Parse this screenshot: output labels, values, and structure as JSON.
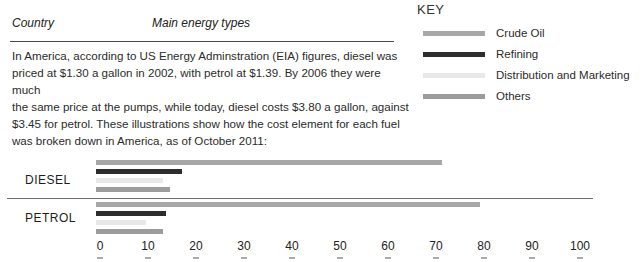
{
  "header": {
    "col1": "Country",
    "col2": "Main energy types"
  },
  "paragraph_lines": [
    "In America, according to US Energy Adminstration (EIA) figures, diesel was",
    "priced at $1.30 a gallon in 2002, with petrol at $1.39. By 2006 they were much",
    "the same price at the pumps, while today, diesel costs $3.80 a gallon, against",
    "$3.45 for petrol. These illustrations show how the cost element for each fuel",
    "was broken down in America, as of October 2011:"
  ],
  "key": {
    "title": "KEY",
    "items": [
      {
        "label": "Crude Oil",
        "color": "#a7a7a7"
      },
      {
        "label": "Refining",
        "color": "#2d2d2d"
      },
      {
        "label": "Distribution and Marketing",
        "color": "#e8e8e8"
      },
      {
        "label": "Others",
        "color": "#9c9c9c"
      }
    ]
  },
  "chart_data": {
    "type": "bar",
    "orientation": "horizontal",
    "title": "",
    "xlabel": "",
    "ylabel": "",
    "categories": [
      "DIESEL",
      "PETROL"
    ],
    "series": [
      {
        "name": "Crude Oil",
        "color": "#a7a7a7",
        "values": [
          72,
          80
        ]
      },
      {
        "name": "Refining",
        "color": "#2d2d2d",
        "values": [
          18,
          14.5
        ]
      },
      {
        "name": "Distribution and Marketing",
        "color": "#e8e8e8",
        "values": [
          14,
          10.5
        ]
      },
      {
        "name": "Others",
        "color": "#9c9c9c",
        "values": [
          15.5,
          14
        ]
      }
    ],
    "x_ticks": [
      0,
      10,
      20,
      30,
      40,
      50,
      60,
      70,
      80,
      90,
      100
    ],
    "xlim": [
      0,
      100
    ],
    "grid": false,
    "legend_position": "top-right"
  }
}
